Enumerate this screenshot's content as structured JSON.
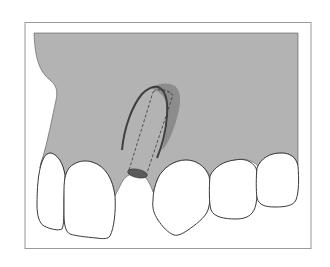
{
  "figure": {
    "type": "dental-illustration",
    "colors": {
      "background": "#ffffff",
      "frame_border": "#9a9a9a",
      "bone": "#b3b3b3",
      "tooth_fill": "#ffffff",
      "tooth_outline": "#3a3a3a",
      "implant_platform": "#5a5a5a",
      "graft_region": "#8c8c8c",
      "cortical_line": "#4a4a4a",
      "implant_outline_dashed": "#444444"
    },
    "elements": {
      "teeth_count": 5,
      "missing_tooth_site": true,
      "implant_shown": true,
      "implant_style": "dashed outline"
    }
  }
}
